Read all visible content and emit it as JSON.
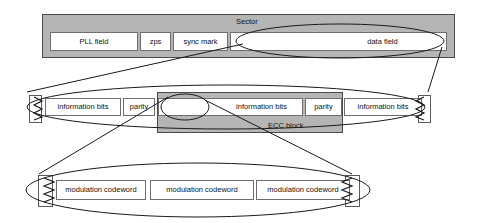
{
  "diagram": {
    "colors": {
      "gray_fill": "#b5b5b5",
      "white_fill": "#ffffff",
      "stroke": "#4a4a4a",
      "text": "#111111"
    },
    "levels": [
      {
        "name": "sector-level",
        "container_label": "Sector",
        "fields": [
          {
            "label": "PLL field"
          },
          {
            "label": "zps"
          },
          {
            "label": "sync mark"
          },
          {
            "label": "data field"
          }
        ]
      },
      {
        "name": "ecc-level",
        "container_label": "ECC block",
        "fields": [
          {
            "label": "information bits"
          },
          {
            "label": "parity"
          },
          {
            "label": "information bits"
          },
          {
            "label": "parity"
          },
          {
            "label": "information bits"
          }
        ]
      },
      {
        "name": "modulation-level",
        "container_label": "",
        "fields": [
          {
            "label": "modulation codeword"
          },
          {
            "label": "modulation codeword"
          },
          {
            "label": "modulation codeword"
          }
        ]
      }
    ],
    "callouts": [
      {
        "name": "data-field-ellipse",
        "from": "data field",
        "to": "ecc-level"
      },
      {
        "name": "ecc-block-ellipse",
        "from": "ECC block",
        "to": "modulation-level"
      }
    ]
  }
}
